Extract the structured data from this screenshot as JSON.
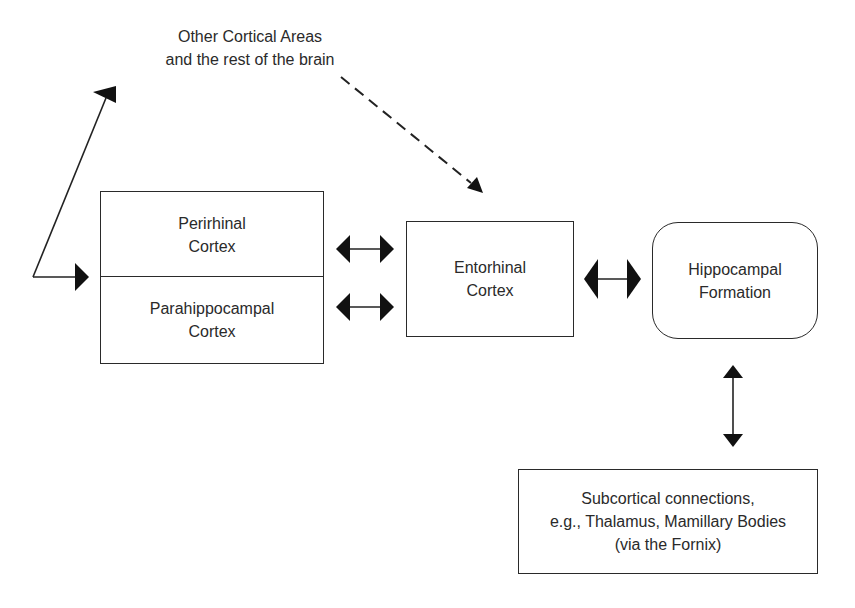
{
  "diagram": {
    "top_label": {
      "line1": "Other Cortical Areas",
      "line2": "and the rest of the brain"
    },
    "nodes": {
      "perirhinal": {
        "line1": "Perirhinal",
        "line2": "Cortex"
      },
      "parahippocampal": {
        "line1": "Parahippocampal",
        "line2": "Cortex"
      },
      "entorhinal": {
        "line1": "Entorhinal",
        "line2": "Cortex"
      },
      "hippocampal": {
        "line1": "Hippocampal",
        "line2": "Formation"
      },
      "subcortical": {
        "line1": "Subcortical connections,",
        "line2": "e.g., Thalamus, Mamillary Bodies",
        "line3": "(via the Fornix)"
      }
    },
    "edges": [
      {
        "from": "parahippocampal-perirhinal",
        "to": "other-cortical-areas",
        "style": "solid",
        "direction": "outgoing"
      },
      {
        "from": "other-cortical-areas",
        "to": "entorhinal",
        "style": "dashed",
        "direction": "one-way"
      },
      {
        "from": "perirhinal",
        "to": "entorhinal",
        "style": "solid",
        "direction": "bidirectional"
      },
      {
        "from": "parahippocampal",
        "to": "entorhinal",
        "style": "solid",
        "direction": "bidirectional"
      },
      {
        "from": "entorhinal",
        "to": "hippocampal",
        "style": "solid",
        "direction": "bidirectional"
      },
      {
        "from": "hippocampal",
        "to": "subcortical",
        "style": "solid",
        "direction": "bidirectional"
      }
    ],
    "colors": {
      "stroke": "#2a2a2a",
      "background": "#ffffff"
    }
  }
}
